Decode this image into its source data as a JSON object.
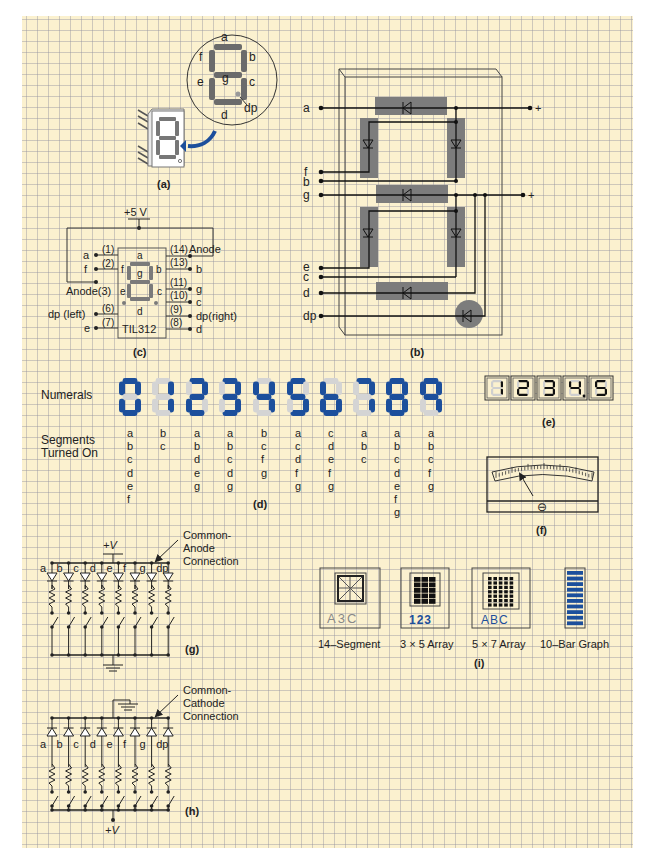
{
  "figure": {
    "panel_a": {
      "caption": "(a)",
      "segment_labels": [
        "a",
        "b",
        "c",
        "d",
        "e",
        "f",
        "g",
        "dp"
      ]
    },
    "panel_b": {
      "caption": "(b)",
      "pin_labels": [
        "a",
        "f",
        "b",
        "g",
        "e",
        "c",
        "d",
        "dp"
      ],
      "supply_labels": [
        "+",
        "+"
      ]
    },
    "panel_c": {
      "caption": "(c)",
      "supply": "+5 V",
      "chip_name": "TIL312",
      "left_pins": [
        {
          "label": "a",
          "pin": "(1)"
        },
        {
          "label": "f",
          "pin": "(2)"
        },
        {
          "label": "Anode(3)",
          "pin": ""
        },
        {
          "label": "dp (left)",
          "pin": "(6)"
        },
        {
          "label": "e",
          "pin": "(7)"
        }
      ],
      "right_pins": [
        {
          "label": "Anode",
          "pin": "(14)"
        },
        {
          "label": "b",
          "pin": "(13)"
        },
        {
          "label": "g",
          "pin": "(11)"
        },
        {
          "label": "c",
          "pin": "(10)"
        },
        {
          "label": "dp(right)",
          "pin": "(9)"
        },
        {
          "label": "d",
          "pin": "(8)"
        }
      ],
      "inner_labels": [
        "a",
        "f",
        "g",
        "b",
        "e",
        "c",
        "d"
      ]
    },
    "panel_d": {
      "caption": "(d)",
      "numerals_label": "Numerals",
      "segments_label_line1": "Segments",
      "segments_label_line2": "Turned On",
      "on_color": "#1c4f9c",
      "off_color": "#d4d4d4",
      "numerals": [
        {
          "digit": "0",
          "segments": [
            "a",
            "b",
            "c",
            "d",
            "e",
            "f"
          ]
        },
        {
          "digit": "1",
          "segments": [
            "b",
            "c"
          ]
        },
        {
          "digit": "2",
          "segments": [
            "a",
            "b",
            "d",
            "e",
            "g"
          ]
        },
        {
          "digit": "3",
          "segments": [
            "a",
            "b",
            "c",
            "d",
            "g"
          ]
        },
        {
          "digit": "4",
          "segments": [
            "b",
            "c",
            "f",
            "g"
          ]
        },
        {
          "digit": "5",
          "segments": [
            "a",
            "c",
            "d",
            "f",
            "g"
          ]
        },
        {
          "digit": "6",
          "segments": [
            "c",
            "d",
            "e",
            "f",
            "g"
          ]
        },
        {
          "digit": "7",
          "segments": [
            "a",
            "b",
            "c"
          ]
        },
        {
          "digit": "8",
          "segments": [
            "a",
            "b",
            "c",
            "d",
            "e",
            "f",
            "g"
          ]
        },
        {
          "digit": "9",
          "segments": [
            "a",
            "b",
            "c",
            "f",
            "g"
          ]
        }
      ]
    },
    "panel_e": {
      "caption": "(e)",
      "reading": "1234.5",
      "digits": [
        "1",
        "2",
        "3",
        "4.",
        "5"
      ]
    },
    "panel_f": {
      "caption": "(f)",
      "zero_adjust_symbol": "⊖"
    },
    "panel_g": {
      "caption": "(g)",
      "supply": "+V",
      "annotation_line1": "Common-",
      "annotation_line2": "Anode",
      "annotation_line3": "Connection",
      "segment_labels": [
        "a",
        "b",
        "c",
        "d",
        "e",
        "f",
        "g",
        "dp"
      ]
    },
    "panel_h": {
      "caption": "(h)",
      "supply": "+V",
      "annotation_line1": "Common-",
      "annotation_line2": "Cathode",
      "annotation_line3": "Connection",
      "segment_labels": [
        "a",
        "b",
        "c",
        "d",
        "e",
        "f",
        "g",
        "dp"
      ]
    },
    "panel_i": {
      "caption": "(i)",
      "displays": [
        {
          "name": "14–Segment",
          "sample": "A3C"
        },
        {
          "name": "3 × 5 Array",
          "sample": "123"
        },
        {
          "name": "5 × 7 Array",
          "sample": "ABC"
        },
        {
          "name": "10–Bar Graph",
          "sample": ""
        }
      ],
      "accent_color": "#1c4f9c"
    }
  }
}
